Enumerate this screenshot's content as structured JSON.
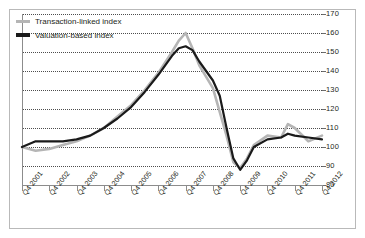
{
  "legend": {
    "position": "top-left",
    "items": [
      {
        "label": "Transaction-linked index",
        "color": "#b5b5b5",
        "key": "transaction_linked"
      },
      {
        "label": "Valuation-based index",
        "color": "#1a1a1a",
        "key": "valuation_based"
      }
    ]
  },
  "chart_data": {
    "type": "line",
    "title": "",
    "subtitle": "",
    "xlabel": "",
    "ylabel": "",
    "ylim": [
      80,
      170
    ],
    "yticks": [
      80,
      90,
      100,
      110,
      120,
      130,
      140,
      150,
      160,
      170
    ],
    "grid": true,
    "grid_style": "dotted-horizontal",
    "categories": [
      "Q4 2001",
      "Q4 2002",
      "Q4 2003",
      "Q4 2004",
      "Q4 2005",
      "Q4 2006",
      "Q4 2007",
      "Q4 2008",
      "Q4 2009",
      "Q4 2010",
      "Q4 2011",
      "Q4 2012"
    ],
    "series": [
      {
        "name": "Transaction-linked index",
        "color": "#b5b5b5",
        "values": [
          100,
          99,
          103,
          110,
          122,
          139,
          156,
          131,
          89,
          106,
          110,
          106
        ]
      },
      {
        "name": "Valuation-based index",
        "color": "#1a1a1a",
        "values": [
          100,
          103,
          104,
          110,
          121,
          138,
          152,
          135,
          88,
          104,
          106,
          104
        ]
      }
    ],
    "series_detailed": [
      {
        "name": "Transaction-linked index",
        "color": "#b5b5b5",
        "points": [
          {
            "x": "Q4 2001",
            "y": 100
          },
          {
            "x": "Q2 2002",
            "y": 98
          },
          {
            "x": "Q4 2002",
            "y": 99
          },
          {
            "x": "Q2 2003",
            "y": 101
          },
          {
            "x": "Q4 2003",
            "y": 103
          },
          {
            "x": "Q2 2004",
            "y": 106
          },
          {
            "x": "Q4 2004",
            "y": 110
          },
          {
            "x": "Q2 2005",
            "y": 116
          },
          {
            "x": "Q4 2005",
            "y": 122
          },
          {
            "x": "Q2 2006",
            "y": 130
          },
          {
            "x": "Q4 2006",
            "y": 139
          },
          {
            "x": "Q2 2007",
            "y": 150
          },
          {
            "x": "Q3 2007",
            "y": 156
          },
          {
            "x": "Q4 2007",
            "y": 160
          },
          {
            "x": "Q1 2008",
            "y": 152
          },
          {
            "x": "Q2 2008",
            "y": 143
          },
          {
            "x": "Q4 2008",
            "y": 131
          },
          {
            "x": "Q2 2009",
            "y": 106
          },
          {
            "x": "Q3 2009",
            "y": 92
          },
          {
            "x": "Q4 2009",
            "y": 89
          },
          {
            "x": "Q1 2010",
            "y": 94
          },
          {
            "x": "Q2 2010",
            "y": 101
          },
          {
            "x": "Q4 2010",
            "y": 106
          },
          {
            "x": "Q2 2011",
            "y": 105
          },
          {
            "x": "Q3 2011",
            "y": 112
          },
          {
            "x": "Q4 2011",
            "y": 110
          },
          {
            "x": "Q2 2012",
            "y": 103
          },
          {
            "x": "Q4 2012",
            "y": 106
          }
        ]
      },
      {
        "name": "Valuation-based index",
        "color": "#1a1a1a",
        "points": [
          {
            "x": "Q4 2001",
            "y": 100
          },
          {
            "x": "Q2 2002",
            "y": 103
          },
          {
            "x": "Q4 2002",
            "y": 103
          },
          {
            "x": "Q2 2003",
            "y": 103
          },
          {
            "x": "Q4 2003",
            "y": 104
          },
          {
            "x": "Q2 2004",
            "y": 106
          },
          {
            "x": "Q4 2004",
            "y": 110
          },
          {
            "x": "Q2 2005",
            "y": 115
          },
          {
            "x": "Q4 2005",
            "y": 121
          },
          {
            "x": "Q2 2006",
            "y": 129
          },
          {
            "x": "Q4 2006",
            "y": 138
          },
          {
            "x": "Q2 2007",
            "y": 148
          },
          {
            "x": "Q3 2007",
            "y": 152
          },
          {
            "x": "Q4 2007",
            "y": 153
          },
          {
            "x": "Q1 2008",
            "y": 151
          },
          {
            "x": "Q2 2008",
            "y": 145
          },
          {
            "x": "Q4 2008",
            "y": 135
          },
          {
            "x": "Q1 2009",
            "y": 127
          },
          {
            "x": "Q2 2009",
            "y": 110
          },
          {
            "x": "Q3 2009",
            "y": 94
          },
          {
            "x": "Q4 2009",
            "y": 88
          },
          {
            "x": "Q1 2010",
            "y": 93
          },
          {
            "x": "Q2 2010",
            "y": 100
          },
          {
            "x": "Q4 2010",
            "y": 104
          },
          {
            "x": "Q2 2011",
            "y": 105
          },
          {
            "x": "Q3 2011",
            "y": 107
          },
          {
            "x": "Q4 2011",
            "y": 106
          },
          {
            "x": "Q2 2012",
            "y": 105
          },
          {
            "x": "Q4 2012",
            "y": 104
          }
        ]
      }
    ]
  }
}
